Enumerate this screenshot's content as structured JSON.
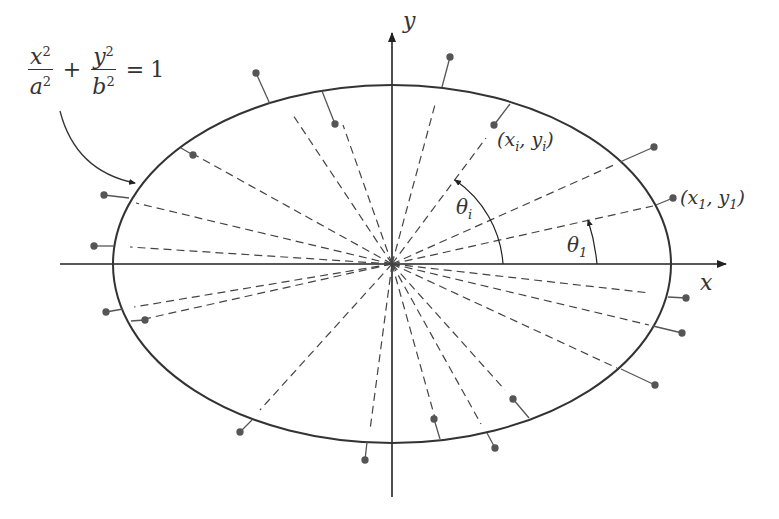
{
  "figure": {
    "equation": {
      "x_num": "x",
      "x_den": "a",
      "y_num": "y",
      "y_den": "b",
      "exp": "2",
      "plus": "+",
      "equals": "=",
      "rhs": "1"
    },
    "axes": {
      "x_label": "x",
      "y_label": "y"
    },
    "labels": {
      "point_i": "(x",
      "point_i_sub": "i",
      "point_i_mid": ", y",
      "point_i_end": ")",
      "point_1": "(x",
      "point_1_sub": "1",
      "point_1_mid": ", y",
      "point_1_end": ")",
      "theta_i": "θ",
      "theta_i_sub": "i",
      "theta_1": "θ",
      "theta_1_sub": "1"
    },
    "colors": {
      "stroke": "#333333",
      "dashed": "#444444",
      "dot": "#555555"
    }
  }
}
